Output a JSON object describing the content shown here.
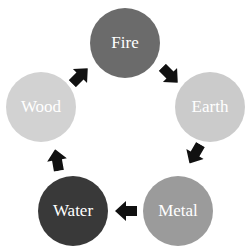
{
  "diagram": {
    "type": "cycle",
    "nodes": [
      {
        "id": "fire",
        "label": "Fire",
        "color": "#6b6b6b",
        "x": 90,
        "y": 8
      },
      {
        "id": "earth",
        "label": "Earth",
        "color": "#cbcbcb",
        "x": 175,
        "y": 72
      },
      {
        "id": "metal",
        "label": "Metal",
        "color": "#9b9b9b",
        "x": 143,
        "y": 176
      },
      {
        "id": "water",
        "label": "Water",
        "color": "#393939",
        "x": 38,
        "y": 176
      },
      {
        "id": "wood",
        "label": "Wood",
        "color": "#d2d2d2",
        "x": 6,
        "y": 72
      }
    ],
    "edges": [
      {
        "from": "wood",
        "to": "fire",
        "cx": 80,
        "cy": 76,
        "angle": -45
      },
      {
        "from": "fire",
        "to": "earth",
        "cx": 170,
        "cy": 75,
        "angle": 45
      },
      {
        "from": "earth",
        "to": "metal",
        "cx": 195,
        "cy": 154,
        "angle": 120
      },
      {
        "from": "metal",
        "to": "water",
        "cx": 126,
        "cy": 211,
        "angle": 180
      },
      {
        "from": "water",
        "to": "wood",
        "cx": 57,
        "cy": 160,
        "angle": -100
      }
    ],
    "arrow_color": "#111111"
  }
}
